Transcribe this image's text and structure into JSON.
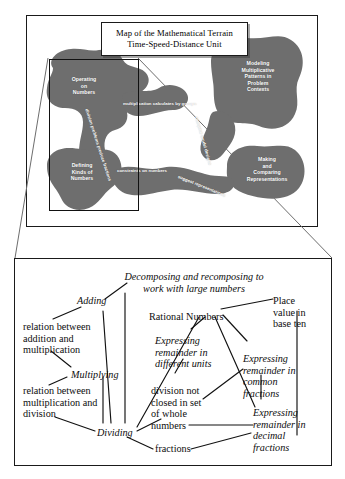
{
  "document": {
    "kind": "concept-map-figure",
    "map_panel": {
      "title_lines": [
        "Map of the Mathematical Terrain",
        "Time-Speed-Distance Unit"
      ],
      "terrain_color": "#6e6e6e",
      "label_color": "#ffffff",
      "regions": [
        {
          "id": "operating-on-numbers",
          "lines": [
            "Operating",
            "on",
            "Numbers"
          ]
        },
        {
          "id": "modeling-multiplicative",
          "lines": [
            "Modeling",
            "Multiplicative",
            "Patterns in",
            "Problem",
            "Contexts"
          ]
        },
        {
          "id": "defining-kinds-of-numbers",
          "lines": [
            "Defining",
            "Kinds of",
            "Numbers"
          ]
        },
        {
          "id": "making-comparing-representations",
          "lines": [
            "Making",
            "and",
            "Comparing",
            "Representations"
          ]
        }
      ],
      "connectors": [
        {
          "id": "multiplication-calculates-by-groups",
          "text": "multiplication calculates by groups"
        },
        {
          "id": "division-problems-produce-fractions",
          "text": "division problems produce fractions"
        },
        {
          "id": "compare-model-designs",
          "text": "compare model designs"
        },
        {
          "id": "constraints-on-numbers",
          "text": "constraints on numbers"
        },
        {
          "id": "suggest-representations",
          "text": "suggest representations"
        }
      ],
      "zoom_region_label": "detail-region"
    },
    "concept_panel": {
      "nodes": [
        {
          "id": "decomposing",
          "text": "Decomposing and recomposing to work with large numbers",
          "style": "italic"
        },
        {
          "id": "adding",
          "text": "Adding",
          "style": "italic"
        },
        {
          "id": "rational-numbers",
          "text": "Rational Numbers",
          "style": "roman"
        },
        {
          "id": "place-value",
          "text": "Place value in base ten",
          "style": "roman"
        },
        {
          "id": "relation-add-mult",
          "text": "relation between addition and multiplication",
          "style": "roman"
        },
        {
          "id": "expressing-different-units",
          "text": "Expressing remainder in different units",
          "style": "italic"
        },
        {
          "id": "expressing-common-fractions",
          "text": "Expressing remainder in common fractions",
          "style": "italic"
        },
        {
          "id": "multiplying",
          "text": "Multiplying",
          "style": "italic"
        },
        {
          "id": "relation-mult-div",
          "text": "relation between multiplication and division",
          "style": "roman"
        },
        {
          "id": "division-not-closed",
          "text": "division not closed in set of whole numbers",
          "style": "roman"
        },
        {
          "id": "expressing-decimal-fractions",
          "text": "Expressing remainder in decimal fractions",
          "style": "italic"
        },
        {
          "id": "dividing",
          "text": "Dividing",
          "style": "italic"
        },
        {
          "id": "fractions",
          "text": "fractions",
          "style": "roman"
        }
      ]
    }
  }
}
